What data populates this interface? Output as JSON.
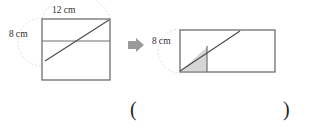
{
  "figure": {
    "colors": {
      "stroke": "#6e6e6e",
      "stroke_dark": "#4a4a4a",
      "line": "#555555",
      "shade_fill": "#d4d4d4",
      "shade_stroke": "#8a8a8a",
      "arrow": "#9a9a9a",
      "arc_dashed": "#cfcfcf",
      "text": "#2f2f2f",
      "background": "#ffffff"
    },
    "left_shape": {
      "name": "square",
      "width_label": "12 cm",
      "height_label": "8 cm",
      "rect": {
        "x": 42,
        "y": 19,
        "w": 68,
        "h": 61
      },
      "diagonal": {
        "x1": 45,
        "y1": 61,
        "x2": 109,
        "y2": 20
      },
      "horizontal_cut": {
        "x1": 42,
        "y1": 41,
        "x2": 110,
        "y2": 41
      },
      "dashed_arc": {
        "cx": 42,
        "cy": 42,
        "r": 24
      }
    },
    "arrow": {
      "name": "right-arrow",
      "glyph": "➜",
      "x": 127,
      "y": 38
    },
    "right_shape": {
      "name": "rectangle",
      "height_label": "8 cm",
      "rect": {
        "x": 180,
        "y": 30,
        "w": 95,
        "h": 42
      },
      "diagonal": {
        "x1": 180,
        "y1": 71,
        "x2": 240,
        "y2": 31
      },
      "vertical_cut": {
        "x1": 207,
        "y1": 46,
        "x2": 207,
        "y2": 72
      },
      "shaded_triangle": "180,71 207,46 207,72",
      "dashed_arc": {
        "cx": 180,
        "cy": 51,
        "r": 19
      }
    },
    "answer_blank": {
      "open_paren": "(",
      "close_paren": ")",
      "value": ""
    }
  }
}
